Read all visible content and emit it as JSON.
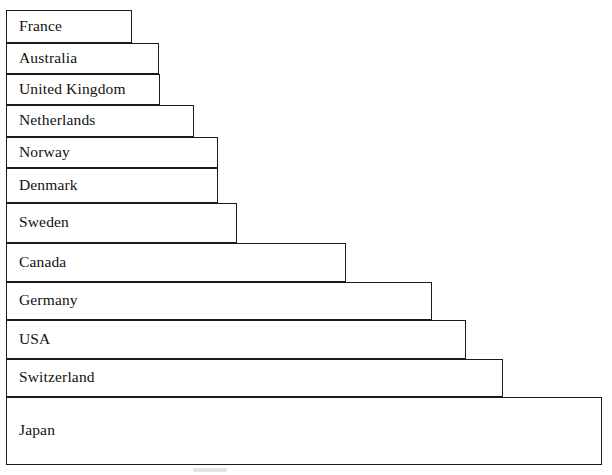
{
  "chart_data": {
    "type": "bar",
    "orientation": "horizontal",
    "title": "",
    "subtitle": "",
    "xlabel": "",
    "ylabel": "",
    "legend": [],
    "grid": false,
    "axis_visible": false,
    "tick_labels": [],
    "note": "Bars drawn as open rectangles with black outlines and white fill; each bar is labelled inside at its left end. Bars are sorted ascending in length from top to bottom.",
    "categories": [
      "France",
      "Australia",
      "United Kingdom",
      "Netherlands",
      "Norway",
      "Denmark",
      "Sweden",
      "Canada",
      "Germany",
      "USA",
      "Switzerland",
      "Japan"
    ],
    "values": [
      126,
      153,
      154,
      188,
      212,
      212,
      231,
      340,
      426,
      460,
      497,
      596
    ],
    "value_unit": "px (bar length measured from the common left baseline)",
    "xlim": [
      0,
      606
    ],
    "bars": [
      {
        "label": "France",
        "value": 126,
        "x": 6,
        "y": 10,
        "width": 126,
        "height": 33
      },
      {
        "label": "Australia",
        "value": 153,
        "x": 6,
        "y": 43,
        "width": 153,
        "height": 31
      },
      {
        "label": "United Kingdom",
        "value": 154,
        "x": 6,
        "y": 74,
        "width": 154,
        "height": 31
      },
      {
        "label": "Netherlands",
        "value": 188,
        "x": 6,
        "y": 105,
        "width": 188,
        "height": 32
      },
      {
        "label": "Norway",
        "value": 212,
        "x": 6,
        "y": 137,
        "width": 212,
        "height": 31
      },
      {
        "label": "Denmark",
        "value": 212,
        "x": 6,
        "y": 168,
        "width": 212,
        "height": 35
      },
      {
        "label": "Sweden",
        "value": 231,
        "x": 6,
        "y": 203,
        "width": 231,
        "height": 40
      },
      {
        "label": "Canada",
        "value": 340,
        "x": 6,
        "y": 243,
        "width": 340,
        "height": 39
      },
      {
        "label": "Germany",
        "value": 426,
        "x": 6,
        "y": 282,
        "width": 426,
        "height": 38
      },
      {
        "label": "USA",
        "value": 460,
        "x": 6,
        "y": 320,
        "width": 460,
        "height": 39
      },
      {
        "label": "Switzerland",
        "value": 497,
        "x": 6,
        "y": 359,
        "width": 497,
        "height": 38
      },
      {
        "label": "Japan",
        "value": 596,
        "x": 6,
        "y": 397,
        "width": 596,
        "height": 68
      }
    ]
  },
  "style": {
    "background_color": "#ffffff",
    "bar_fill_color": "#ffffff",
    "bar_border_color": "#1a1a1a",
    "label_color": "#111111"
  }
}
